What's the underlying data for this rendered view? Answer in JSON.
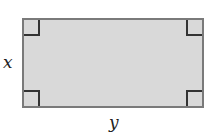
{
  "diagram": {
    "shape": "rectangle",
    "fill_color": "#d9d9d9",
    "border_color": "#7a7a7a",
    "right_angle_markers": 4,
    "labels": {
      "height": "x",
      "width": "y"
    }
  }
}
